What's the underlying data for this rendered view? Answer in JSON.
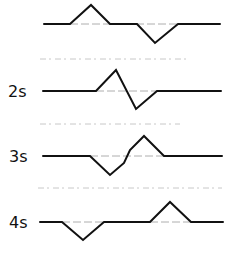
{
  "diagram": {
    "type": "waveform-sequence",
    "stroke_color": "#111111",
    "baseline_color": "#9a9a9a",
    "separator_color": "#c8c8c8",
    "rows": [
      {
        "label": "",
        "label_pos": [
          0,
          0
        ],
        "baseline_y": 24,
        "points": [
          [
            44,
            24
          ],
          [
            70,
            24
          ],
          [
            91,
            5
          ],
          [
            110,
            24
          ],
          [
            137,
            24
          ],
          [
            155,
            43
          ],
          [
            178,
            24
          ],
          [
            220,
            24
          ]
        ],
        "baseline_segment": [
          [
            70,
            24
          ],
          [
            178,
            24
          ]
        ]
      },
      {
        "label": "2s",
        "label_pos": [
          8,
          84
        ],
        "baseline_y": 91,
        "points": [
          [
            43,
            91
          ],
          [
            96,
            91
          ],
          [
            116,
            70
          ],
          [
            136,
            109
          ],
          [
            157,
            91
          ],
          [
            221,
            91
          ]
        ],
        "baseline_segment": [
          [
            96,
            91
          ],
          [
            157,
            91
          ]
        ]
      },
      {
        "label": "3s",
        "label_pos": [
          9,
          149
        ],
        "baseline_y": 156,
        "points": [
          [
            43,
            156
          ],
          [
            90,
            156
          ],
          [
            110,
            175
          ],
          [
            124,
            163
          ],
          [
            130,
            150
          ],
          [
            144,
            136
          ],
          [
            164,
            156
          ],
          [
            222,
            156
          ]
        ],
        "baseline_segment": [
          [
            90,
            156
          ],
          [
            164,
            156
          ]
        ]
      },
      {
        "label": "4s",
        "label_pos": [
          9,
          215
        ],
        "baseline_y": 222,
        "points": [
          [
            40,
            222
          ],
          [
            62,
            222
          ],
          [
            83,
            240
          ],
          [
            104,
            222
          ],
          [
            150,
            222
          ],
          [
            170,
            202
          ],
          [
            191,
            222
          ],
          [
            223,
            222
          ]
        ],
        "baseline_segment": [
          [
            62,
            222
          ],
          [
            191,
            222
          ]
        ]
      }
    ],
    "separators": [
      {
        "y": 59,
        "x1": 40,
        "x2": 190
      },
      {
        "y": 124,
        "x1": 40,
        "x2": 180
      },
      {
        "y": 188,
        "x1": 38,
        "x2": 222
      }
    ]
  }
}
